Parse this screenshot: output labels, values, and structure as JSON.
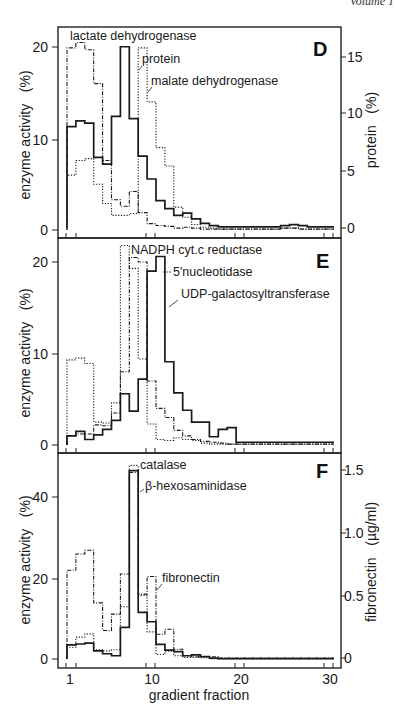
{
  "header": {
    "text": "Volume 1"
  },
  "chart_data": [
    {
      "panel": "D",
      "type": "line",
      "style": "step-histogram",
      "xlabel": "gradient fraction",
      "ylabel": "enzyme activity   (%)",
      "ylabel_right": "protein   (%)",
      "x": [
        1,
        2,
        3,
        4,
        5,
        6,
        7,
        8,
        9,
        10,
        11,
        12,
        13,
        14,
        15,
        16,
        17,
        18,
        19,
        20,
        21,
        22,
        23,
        24,
        25,
        26,
        27,
        28,
        29,
        30
      ],
      "xticks": [
        1,
        10,
        20,
        30
      ],
      "yticks": [
        0,
        10,
        20
      ],
      "yticks_right": [
        0,
        5,
        10,
        15
      ],
      "ylim": [
        0,
        22
      ],
      "ylim_right": [
        0,
        17.4
      ],
      "series": [
        {
          "name": "protein",
          "axis": "right",
          "line": "solid",
          "values": [
            8.9,
            9.4,
            9.2,
            6.2,
            5.6,
            9.8,
            15.9,
            9.6,
            6.3,
            4.3,
            2.4,
            1.7,
            1.1,
            1.3,
            0.8,
            0.4,
            0.2,
            0.1,
            0.1,
            0.1,
            0.1,
            0.1,
            0.1,
            0.1,
            0.2,
            0.3,
            0.2,
            0.1,
            0.1,
            0.1
          ]
        },
        {
          "name": "lactate dehydrogenase",
          "axis": "left",
          "line": "dashdot",
          "values": [
            19.9,
            20.5,
            19.7,
            16.0,
            7.6,
            3.3,
            2.6,
            4.2,
            1.9,
            0.7,
            0.5,
            0.4,
            0.2,
            0.3,
            0.2,
            0.1,
            0.1,
            0.1,
            0.1,
            0.1,
            0.1,
            0.1,
            0.1,
            0.1,
            0.2,
            0.2,
            0.1,
            0.1,
            0.1,
            0.1
          ]
        },
        {
          "name": "malate dehydrogenase",
          "axis": "left",
          "line": "dotted",
          "values": [
            6.0,
            7.6,
            7.8,
            5.0,
            2.9,
            1.6,
            1.6,
            1.8,
            19.9,
            14.0,
            9.0,
            7.0,
            2.5,
            1.4,
            0.6,
            0.3,
            0.2,
            0.1,
            0.1,
            0.1,
            0.1,
            0.1,
            0.1,
            0.1,
            0.2,
            0.2,
            0.1,
            0.1,
            0.1,
            0.1
          ]
        }
      ],
      "annotations": [
        "lactate dehydrogenase",
        "protein",
        "malate dehydrogenase"
      ]
    },
    {
      "panel": "E",
      "type": "line",
      "style": "step-histogram",
      "xlabel": "gradient fraction",
      "ylabel": "enzyme activity   (%)",
      "x": [
        1,
        2,
        3,
        4,
        5,
        6,
        7,
        8,
        9,
        10,
        11,
        12,
        13,
        14,
        15,
        16,
        17,
        18,
        19,
        20,
        21,
        22,
        23,
        24,
        25,
        26,
        27,
        28,
        29,
        30
      ],
      "xticks": [
        1,
        10,
        20,
        30
      ],
      "yticks": [
        0,
        10,
        20
      ],
      "ylim": [
        -0.8,
        22.5
      ],
      "series": [
        {
          "name": "UDP-galactosyltransferase",
          "line": "solid",
          "values": [
            1.0,
            1.5,
            0.6,
            1.1,
            1.7,
            2.7,
            5.6,
            3.7,
            7.2,
            19.0,
            20.6,
            9.1,
            5.7,
            3.8,
            2.5,
            2.5,
            0.9,
            1.7,
            1.9,
            0.3,
            0.3,
            0.3,
            0.3,
            0.3,
            0.3,
            0.3,
            0.3,
            0.3,
            0.3,
            0.3
          ]
        },
        {
          "name": "5'nucleotidase",
          "line": "dashdot",
          "values": [
            1.0,
            1.2,
            1.2,
            2.2,
            2.1,
            3.5,
            8.0,
            20.5,
            20.0,
            7.0,
            4.0,
            3.0,
            1.6,
            1.0,
            0.6,
            0.4,
            0.3,
            0.2,
            0.1,
            0.1,
            0.1,
            0.1,
            0.1,
            0.1,
            0.1,
            0.1,
            0.1,
            0.1,
            0.1,
            0.1
          ]
        },
        {
          "name": "NADPH cyt.c reductase",
          "line": "dotted",
          "values": [
            9.3,
            9.5,
            8.9,
            2.5,
            2.4,
            4.6,
            21.8,
            19.3,
            9.4,
            2.3,
            0.6,
            0.5,
            0.8,
            0.6,
            0.5,
            0.2,
            0.1,
            0.1,
            0.1,
            0.1,
            0.1,
            0.1,
            0.1,
            0.1,
            0.1,
            0.1,
            0.1,
            0.1,
            0.1,
            0.1
          ]
        }
      ],
      "annotations": [
        "NADPH cyt.c reductase",
        "5'nucleotidase",
        "UDP-galactosyltransferase"
      ]
    },
    {
      "panel": "F",
      "type": "line",
      "style": "step-histogram",
      "xlabel": "gradient fraction",
      "ylabel": "enzyme activity   (%)",
      "ylabel_right": "fibronectin   (µg/ml)",
      "x": [
        1,
        2,
        3,
        4,
        5,
        6,
        7,
        8,
        9,
        10,
        11,
        12,
        13,
        14,
        15,
        16,
        17,
        18,
        19,
        20,
        21,
        22,
        23,
        24,
        25,
        26,
        27,
        28,
        29,
        30
      ],
      "xticks": [
        1,
        10,
        20,
        30
      ],
      "yticks": [
        0,
        20,
        40
      ],
      "yticks_right": [
        0,
        0.5,
        1.0,
        1.5
      ],
      "ylim": [
        -2.5,
        50
      ],
      "ylim_right": [
        -0.08,
        1.63
      ],
      "series": [
        {
          "name": "β-hexosaminidase",
          "axis": "left",
          "line": "solid",
          "values": [
            3.5,
            3.7,
            3.9,
            2.0,
            1.3,
            0.8,
            7.8,
            46.5,
            11.5,
            9.2,
            3.6,
            2.2,
            1.8,
            0.8,
            1.0,
            0.6,
            0.2,
            0.1,
            0.1,
            0.1,
            0.1,
            0.1,
            0.1,
            0.1,
            0.1,
            0.1,
            0.1,
            0.1,
            0.1,
            0.1
          ]
        },
        {
          "name": "catalase",
          "axis": "left",
          "line": "dotted",
          "values": [
            2.9,
            5.4,
            6.2,
            2.3,
            2.0,
            2.3,
            12.9,
            47.8,
            15.7,
            6.7,
            1.1,
            1.9,
            0.8,
            0.4,
            0.4,
            0.3,
            0.1,
            0.1,
            0.1,
            0.1,
            0.1,
            0.1,
            0.1,
            0.1,
            0.1,
            0.1,
            0.1,
            0.1,
            0.1,
            0.1
          ]
        },
        {
          "name": "fibronectin",
          "axis": "right",
          "line": "dashdot",
          "values": [
            0.7,
            0.83,
            0.86,
            0.44,
            0.22,
            0.35,
            0.67,
            1.48,
            0.51,
            0.65,
            0.19,
            0.23,
            0.07,
            0.02,
            0.01,
            0.01,
            0.01,
            0.0,
            0.0,
            0.0,
            0.0,
            0.0,
            0.0,
            0.0,
            0.0,
            0.0,
            0.0,
            0.0,
            0.0,
            0.0
          ]
        }
      ],
      "annotations": [
        "catalase",
        "β-hexosaminidase",
        "fibronectin"
      ]
    }
  ],
  "panels": {
    "D": {
      "letter": "D",
      "ylabel": "enzyme activity   (%)",
      "ylabel_right": "protein   (%)",
      "ytick_labels": [
        "20",
        "10",
        "0"
      ],
      "ytick_labels_right": [
        "15",
        "10",
        "5",
        "0"
      ],
      "labels": {
        "ldh": "lactate dehydrogenase",
        "protein": "protein",
        "mdh": "malate dehydrogenase"
      }
    },
    "E": {
      "letter": "E",
      "ylabel": "enzyme activity   (%)",
      "ytick_labels": [
        "20",
        "10",
        "0"
      ],
      "labels": {
        "nadph": "NADPH cyt.c reductase",
        "nuc": "5'nucleotidase",
        "udp": "UDP-galactosyltransferase"
      }
    },
    "F": {
      "letter": "F",
      "ylabel": "enzyme activity   (%)",
      "ylabel_right": "fibronectin   (µg/ml)",
      "ytick_labels": [
        "40",
        "20",
        "0"
      ],
      "ytick_labels_right": [
        "1.5",
        "1.0",
        "0.5",
        "0"
      ],
      "xtick_labels": [
        "1",
        "10",
        "20",
        "30"
      ],
      "xlabel": "gradient fraction",
      "labels": {
        "catalase": "catalase",
        "hex": "β-hexosaminidase",
        "fn": "fibronectin"
      }
    }
  }
}
